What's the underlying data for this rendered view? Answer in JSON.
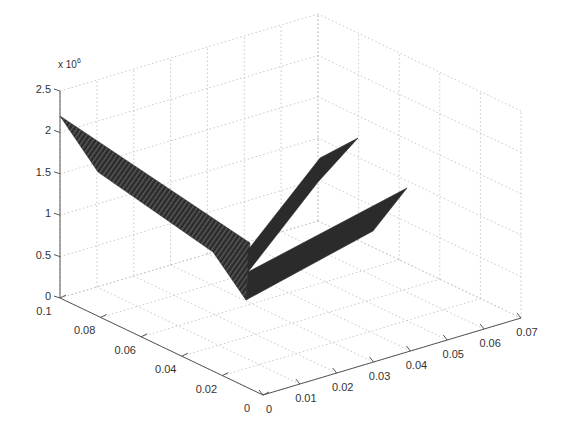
{
  "chart_data": {
    "type": "surface3d",
    "title": "",
    "xlabel": "",
    "ylabel": "",
    "zlabel": "",
    "z_multiplier_label": "x 10",
    "z_multiplier_exponent": "6",
    "x_axis": {
      "range": [
        0,
        0.07
      ],
      "ticks": [
        0,
        0.01,
        0.02,
        0.03,
        0.04,
        0.05,
        0.06,
        0.07
      ],
      "tick_labels": [
        "0",
        "0.01",
        "0.02",
        "0.03",
        "0.04",
        "0.05",
        "0.06",
        "0.07"
      ]
    },
    "y_axis": {
      "range": [
        0,
        0.1
      ],
      "ticks": [
        0,
        0.02,
        0.04,
        0.06,
        0.08,
        0.1
      ],
      "tick_labels": [
        "0",
        "0.02",
        "0.04",
        "0.06",
        "0.08",
        "0.1"
      ]
    },
    "z_axis": {
      "range": [
        0,
        2500000
      ],
      "ticks": [
        0,
        500000,
        1000000,
        1500000,
        2000000,
        2500000
      ],
      "tick_labels": [
        "0",
        "0.5",
        "1",
        "1.5",
        "2",
        "2.5"
      ]
    },
    "grid": true,
    "legend": null,
    "surface_color": "#2b2b2b",
    "surfaces": [
      {
        "name": "band-along-y",
        "description": "ribbon at x≈0 running from y=0.1 down to y≈0.006, z decreasing from ~2.2e6 to ~0",
        "polygon_screen": [
          [
            60,
            116
          ],
          [
            250,
            243
          ],
          [
            246,
            300
          ],
          [
            213,
            252
          ],
          [
            98,
            172
          ]
        ]
      },
      {
        "name": "prong-upper",
        "description": "ribbon from y≈0.006 x≈0 rising along x to ~0.04, z up to ~1.5e6",
        "polygon_screen": [
          [
            248,
            250
          ],
          [
            320,
            158
          ],
          [
            358,
            138
          ],
          [
            318,
            182
          ],
          [
            248,
            272
          ]
        ]
      },
      {
        "name": "prong-lower",
        "description": "ribbon from origin region rising along x to ~0.06, z up to ~1.3e6",
        "polygon_screen": [
          [
            248,
            272
          ],
          [
            407,
            188
          ],
          [
            373,
            231
          ],
          [
            246,
            300
          ]
        ]
      }
    ]
  },
  "projection": {
    "origin_floor": [
      263,
      395
    ],
    "y_end_floor": [
      60,
      298
    ],
    "x_end_floor": [
      521,
      318
    ],
    "z_top_offset": -207
  },
  "colors": {
    "axis": "#555555",
    "grid": "#c8c8c8",
    "text": "#333333",
    "surface": "#2b2b2b",
    "surface_stripe": "#555555"
  }
}
